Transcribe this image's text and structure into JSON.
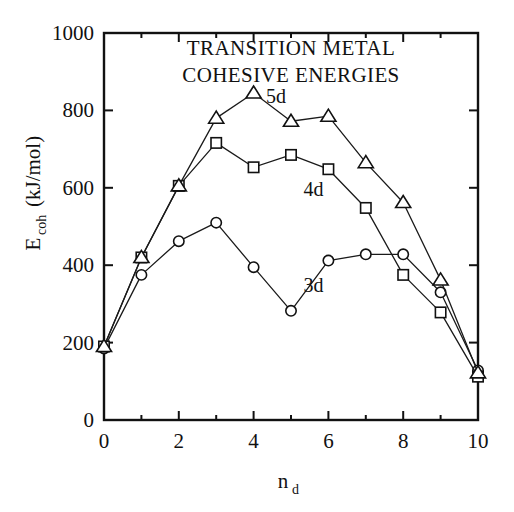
{
  "chart_data": {
    "type": "line",
    "title": "TRANSITION METAL COHESIVE ENERGIES",
    "title_lines": [
      "TRANSITION METAL",
      "COHESIVE ENERGIES"
    ],
    "xlabel": "n_d",
    "xlabel_base": "n",
    "xlabel_sub": "d",
    "ylabel": "Ecoh (kJ/mol)",
    "ylabel_base": "E",
    "ylabel_sub": "coh",
    "ylabel_rest": " (kJ/mol)",
    "xlim": [
      0,
      10
    ],
    "ylim": [
      0,
      1000
    ],
    "xticks": [
      0,
      2,
      4,
      6,
      8,
      10
    ],
    "xtick_labels": [
      "0",
      "2",
      "4",
      "6",
      "8",
      "10"
    ],
    "xticks_minor": [
      1,
      3,
      5,
      7,
      9
    ],
    "yticks": [
      0,
      200,
      400,
      600,
      800,
      1000
    ],
    "ytick_labels": [
      "0",
      "200",
      "400",
      "600",
      "800",
      "1000"
    ],
    "grid": false,
    "legend": "inline-annotations",
    "x": [
      0,
      1,
      2,
      3,
      4,
      5,
      6,
      7,
      8,
      9,
      10
    ],
    "series": [
      {
        "name": "3d",
        "marker": "circle",
        "label": "3d",
        "label_x": 5.6,
        "label_y": 330,
        "values": [
          185,
          375,
          462,
          510,
          395,
          282,
          412,
          428,
          428,
          330,
          128
        ]
      },
      {
        "name": "4d",
        "marker": "square",
        "label": "4d",
        "label_x": 5.6,
        "label_y": 580,
        "values": [
          190,
          420,
          605,
          716,
          653,
          685,
          648,
          548,
          375,
          278,
          112
        ]
      },
      {
        "name": "5d",
        "marker": "triangle",
        "label": "5d",
        "label_x": 4.6,
        "label_y": 818,
        "values": [
          190,
          420,
          605,
          780,
          845,
          772,
          785,
          665,
          562,
          362,
          122
        ]
      }
    ]
  },
  "colors": {
    "background": "#ffffff",
    "ink": "#111111",
    "line": "#1a1a1a",
    "marker_fill": "#ffffff"
  },
  "geometry": {
    "plot_left": 104,
    "plot_right": 478,
    "plot_top": 33,
    "plot_bottom": 420
  }
}
